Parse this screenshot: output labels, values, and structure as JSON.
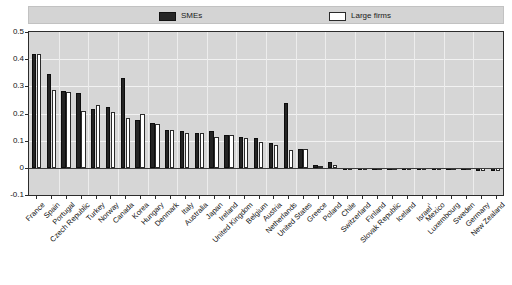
{
  "legend": {
    "items": [
      {
        "label": "SMEs",
        "swatch": "filled-dark-square-icon",
        "color": "#242424"
      },
      {
        "label": "Large firms",
        "swatch": "hollow-white-square-icon",
        "color": "#ffffff"
      }
    ]
  },
  "axes": {
    "y_ticks": [
      "0.5",
      "0.4",
      "0.3",
      "0.2",
      "0.1",
      "0",
      "-0.1"
    ]
  },
  "chart_data": {
    "type": "bar",
    "title": "",
    "subtitle": "",
    "xlabel": "",
    "ylabel": "",
    "ylim": [
      -0.1,
      0.5
    ],
    "ytick_values": [
      0.5,
      0.4,
      0.3,
      0.2,
      0.1,
      0,
      -0.1
    ],
    "grid": true,
    "legend_position": "top",
    "categories": [
      "France",
      "Spain",
      "Portugal",
      "Czech Republic",
      "Turkey",
      "Norway",
      "Canada",
      "Korea",
      "Hungary",
      "Denmark",
      "Italy",
      "Australia",
      "Japan",
      "Ireland",
      "United Kingdom",
      "Belgium",
      "Austria",
      "Netherlands",
      "United States",
      "Greece",
      "Poland",
      "Chile",
      "Switzerland",
      "Finland",
      "Slovak Republic",
      "Iceland",
      "Israel¹",
      "Mexico",
      "Luxembourg",
      "Sweden",
      "Germany",
      "New Zealand"
    ],
    "series": [
      {
        "name": "SMEs",
        "color": "#242424",
        "values": [
          0.42,
          0.345,
          0.283,
          0.275,
          0.215,
          0.225,
          0.33,
          0.175,
          0.165,
          0.14,
          0.135,
          0.13,
          0.135,
          0.12,
          0.115,
          0.11,
          0.09,
          0.24,
          0.07,
          0.01,
          0.02,
          -0.005,
          -0.005,
          -0.008,
          -0.008,
          -0.008,
          -0.008,
          -0.008,
          -0.008,
          -0.008,
          -0.01,
          -0.012
        ]
      },
      {
        "name": "Large firms",
        "color": "#ffffff",
        "values": [
          0.42,
          0.285,
          0.28,
          0.21,
          0.23,
          0.205,
          0.185,
          0.2,
          0.16,
          0.14,
          0.13,
          0.13,
          0.115,
          0.12,
          0.11,
          0.095,
          0.085,
          0.065,
          0.07,
          0.005,
          0.012,
          -0.005,
          -0.006,
          -0.006,
          -0.006,
          -0.008,
          -0.008,
          -0.008,
          -0.008,
          -0.008,
          -0.01,
          -0.012
        ]
      }
    ]
  }
}
